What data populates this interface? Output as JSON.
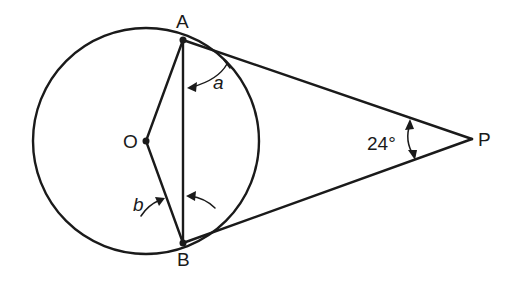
{
  "figure": {
    "type": "geometry",
    "points": {
      "A": {
        "label": "A",
        "x": 183,
        "y": 40
      },
      "B": {
        "label": "B",
        "x": 183,
        "y": 243
      },
      "O": {
        "label": "O",
        "x": 146,
        "y": 141
      },
      "P": {
        "label": "P",
        "x": 472,
        "y": 139
      }
    },
    "circle": {
      "center": "O",
      "radius": 113
    },
    "angles": {
      "a": {
        "label": "a",
        "description": "angle between tangent PA and chord AB at A"
      },
      "b": {
        "label": "b",
        "description": "angle OBA between radius OB and chord AB"
      },
      "P": {
        "label": "24°",
        "value": 24,
        "description": "angle APB between tangents"
      }
    },
    "colors": {
      "line": "#1a1a1a",
      "background": "#ffffff"
    }
  }
}
